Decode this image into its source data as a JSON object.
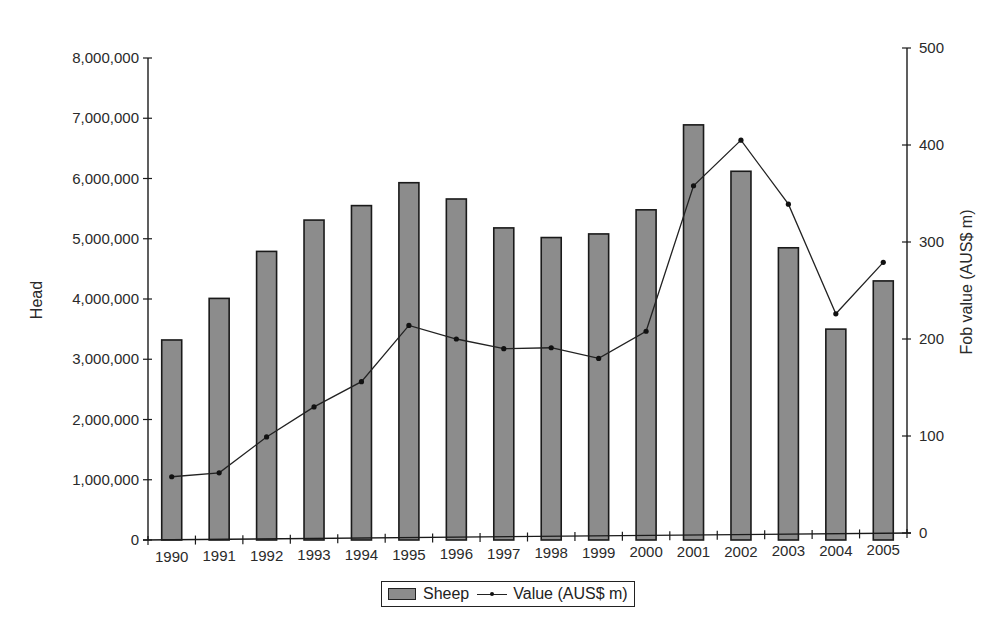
{
  "chart_data": {
    "type": "bar+line",
    "title": "",
    "xlabel": "",
    "ylabel": "Head",
    "y2label": "Fob value (AUS$ m)",
    "categories": [
      "1990",
      "1991",
      "1992",
      "1993",
      "1994",
      "1995",
      "1996",
      "1997",
      "1998",
      "1999",
      "2000",
      "2001",
      "2002",
      "2003",
      "2004",
      "2005"
    ],
    "series": [
      {
        "name": "Sheep",
        "type": "bar",
        "axis": "left",
        "color": "#8c8c8c",
        "values": [
          3320000,
          4010000,
          4790000,
          5310000,
          5550000,
          5930000,
          5660000,
          5180000,
          5020000,
          5080000,
          5480000,
          6890000,
          6120000,
          4850000,
          3500000,
          4300000
        ]
      },
      {
        "name": "Value (AUS$ m)",
        "type": "line",
        "axis": "right",
        "color": "#222222",
        "values": [
          58,
          62,
          99,
          130,
          156,
          214,
          200,
          190,
          191,
          180,
          208,
          358,
          405,
          339,
          226,
          279
        ]
      }
    ],
    "ylim": [
      0,
      8000000
    ],
    "y2lim": [
      0,
      500
    ],
    "yticks": [
      "0",
      "1,000,000",
      "2,000,000",
      "3,000,000",
      "4,000,000",
      "5,000,000",
      "6,000,000",
      "7,000,000",
      "8,000,000"
    ],
    "y2ticks": [
      "0",
      "100",
      "200",
      "300",
      "400",
      "500"
    ],
    "grid": false,
    "legend_position": "bottom"
  },
  "legend": {
    "bar_label": "Sheep",
    "line_label": "Value (AUS$ m)"
  }
}
